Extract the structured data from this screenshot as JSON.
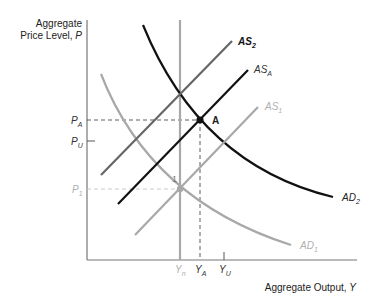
{
  "diagram": {
    "y_axis_label_line1": "Aggregate",
    "y_axis_label_line2": "Price Level, ",
    "y_axis_var": "P",
    "x_axis_label": "Aggregate Output, ",
    "x_axis_var": "Y",
    "colors": {
      "black": "#111111",
      "dark_gray": "#666666",
      "light_gray": "#a8a8a8",
      "axis": "#777777"
    },
    "curves": [
      {
        "id": "AD1",
        "label": "AD",
        "sub": "1",
        "color": "#a8a8a8"
      },
      {
        "id": "AD2",
        "label": "AD",
        "sub": "2",
        "color": "#111111"
      },
      {
        "id": "AS1",
        "label": "AS",
        "sub": "1",
        "color": "#a8a8a8"
      },
      {
        "id": "ASA",
        "label": "AS",
        "sub": "A",
        "color": "#111111"
      },
      {
        "id": "AS2",
        "label": "AS",
        "sub": "2",
        "color": "#666666"
      },
      {
        "id": "LRAS",
        "label": "",
        "sub": "",
        "color": "#a8a8a8"
      }
    ],
    "y_ticks": [
      {
        "label": "P",
        "sub": "A"
      },
      {
        "label": "P",
        "sub": "U"
      },
      {
        "label": "P",
        "sub": "1"
      }
    ],
    "x_ticks": [
      {
        "label": "Y",
        "sub": "n"
      },
      {
        "label": "Y",
        "sub": "A"
      },
      {
        "label": "Y",
        "sub": "U"
      }
    ],
    "points": [
      {
        "label": "A"
      },
      {
        "label": "1"
      }
    ]
  }
}
